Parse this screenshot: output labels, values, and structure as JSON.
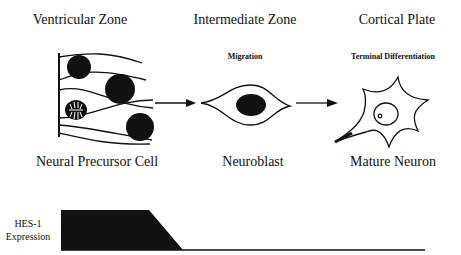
{
  "zones": [
    {
      "title": "Ventricular Zone",
      "subtitle": "",
      "cell": "Neural Precursor Cell"
    },
    {
      "title": "Intermediate Zone",
      "subtitle": "Migration",
      "cell": "Neuroblast"
    },
    {
      "title": "Cortical Plate",
      "subtitle": "Terminal Differentiation",
      "cell": "Mature Neuron"
    }
  ],
  "expression": {
    "label_line1": "HES-1",
    "label_line2": "Expression",
    "profile": "high in neural precursor cells, declines before neuroblast stage, absent in mature neurons"
  },
  "colors": {
    "ink": "#111111",
    "background": "#ffffff"
  }
}
